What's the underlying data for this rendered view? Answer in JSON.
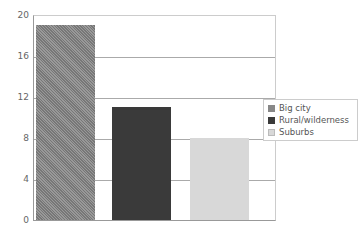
{
  "chart_data": {
    "type": "bar",
    "title": "",
    "xlabel": "",
    "ylabel": "",
    "categories": [
      "Big city",
      "Rural/wilderness",
      "Suburbs"
    ],
    "values": [
      19,
      11,
      8
    ],
    "colors": [
      "#888888",
      "#3a3a3a",
      "#d8d8d8"
    ],
    "ylim": [
      0,
      20
    ],
    "yticks": [
      0,
      4,
      8,
      12,
      16,
      20
    ],
    "grid": true,
    "legend_position": "right"
  },
  "legend": {
    "items": [
      {
        "label": "Big city"
      },
      {
        "label": "Rural/wilderness"
      },
      {
        "label": "Suburbs"
      }
    ]
  },
  "yticks": {
    "t0": "0",
    "t4": "4",
    "t8": "8",
    "t12": "12",
    "t16": "16",
    "t20": "20"
  }
}
